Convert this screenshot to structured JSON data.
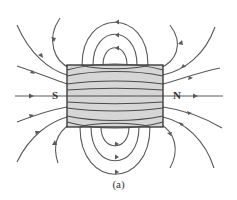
{
  "diagram": {
    "poles": {
      "south": "S",
      "north": "N"
    },
    "caption": "(a)",
    "colors": {
      "magnet_fill": "#d6d6d6",
      "magnet_border": "#2e2e2e",
      "field_line": "#5a5a5a"
    }
  }
}
